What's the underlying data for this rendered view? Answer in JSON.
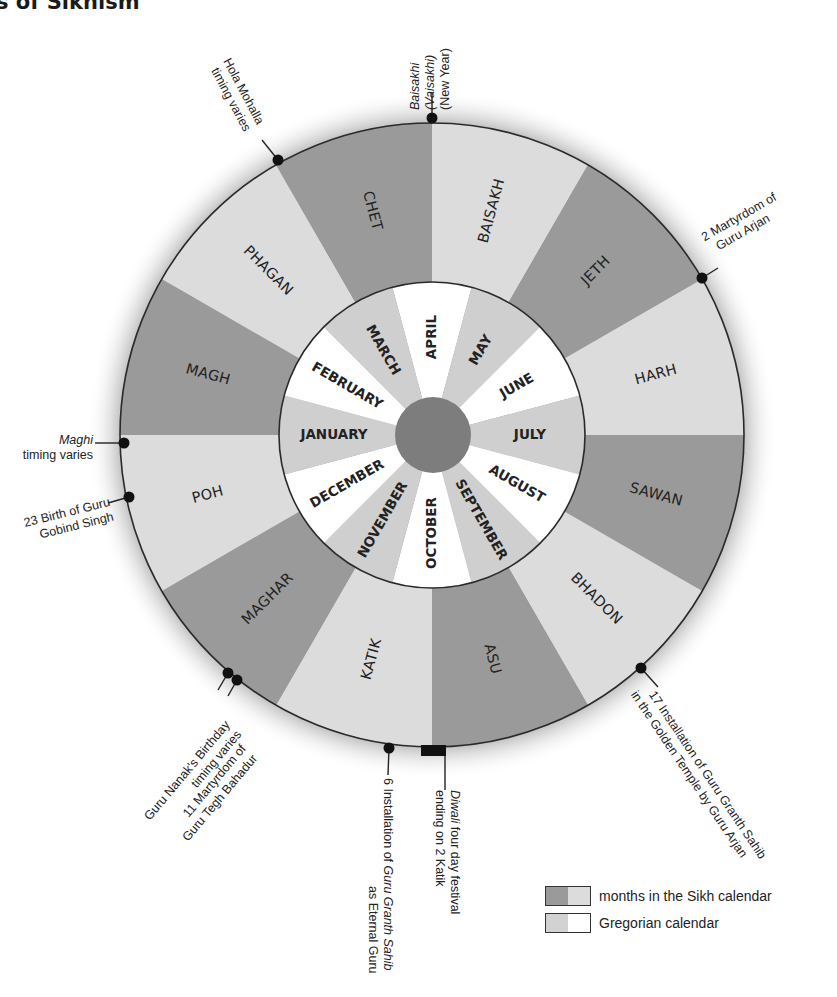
{
  "title_visible": "ts of Sikhism",
  "colors": {
    "sikh_dark": "#9a9a9a",
    "sikh_light": "#dcdcdc",
    "greg_gray": "#cfcfcf",
    "greg_white": "#ffffff",
    "hub": "#7d7d7d",
    "outline": "#2a2a2a",
    "marker": "#111111"
  },
  "outer_ring": {
    "label": "months in the Sikh calendar",
    "segments": [
      {
        "name": "BAISAKH",
        "shade": "light"
      },
      {
        "name": "JETH",
        "shade": "dark"
      },
      {
        "name": "HARH",
        "shade": "light"
      },
      {
        "name": "SAWAN",
        "shade": "dark"
      },
      {
        "name": "BHADON",
        "shade": "light"
      },
      {
        "name": "ASU",
        "shade": "dark"
      },
      {
        "name": "KATIK",
        "shade": "light"
      },
      {
        "name": "MAGHAR",
        "shade": "dark"
      },
      {
        "name": "POH",
        "shade": "light"
      },
      {
        "name": "MAGH",
        "shade": "dark"
      },
      {
        "name": "PHAGAN",
        "shade": "light"
      },
      {
        "name": "CHET",
        "shade": "dark"
      }
    ]
  },
  "inner_ring": {
    "label": "Gregorian calendar",
    "segments": [
      {
        "name": "APRIL",
        "shade": "white"
      },
      {
        "name": "MAY",
        "shade": "gray"
      },
      {
        "name": "JUNE",
        "shade": "white"
      },
      {
        "name": "JULY",
        "shade": "gray"
      },
      {
        "name": "AUGUST",
        "shade": "white"
      },
      {
        "name": "SEPTEMBER",
        "shade": "gray"
      },
      {
        "name": "OCTOBER",
        "shade": "white"
      },
      {
        "name": "NOVEMBER",
        "shade": "gray"
      },
      {
        "name": "DECEMBER",
        "shade": "white"
      },
      {
        "name": "JANUARY",
        "shade": "gray"
      },
      {
        "name": "FEBRUARY",
        "shade": "white"
      },
      {
        "name": "MARCH",
        "shade": "gray"
      }
    ]
  },
  "annotations": {
    "baisakhi": {
      "line1": "Baisakhi",
      "line2": "(Vaisakhi)",
      "line3": "(New Year)"
    },
    "hola_mohalla": {
      "line1": "Hola Mohalla",
      "line2": "timing varies"
    },
    "martyrdom_arjan": {
      "line1": "2 Martyrdom of",
      "line2": "Guru Arjan"
    },
    "maghi": {
      "line1": "Maghi",
      "line2": "timing varies"
    },
    "birth_gobind": {
      "line1": "23 Birth of Guru",
      "line2": "Gobind Singh"
    },
    "nanak_birthday": {
      "line1": "Guru Nanak's Birthday",
      "line2": "timing varies"
    },
    "martyrdom_tegh": {
      "line1": "11 Martyrdom of",
      "line2": "Guru Tegh Bahadur"
    },
    "installation_eternal": {
      "line1a": "6 Installation of ",
      "line1b": "Guru Granth Sahib",
      "line2": "as Eternal Guru"
    },
    "diwali": {
      "line1a": "Diwali",
      "line1b": " four day festival",
      "line2": "ending on 2 Katik"
    },
    "installation_golden": {
      "line1": "17 Installation of Guru Granth Sahib",
      "line2": "in the Golden Temple by Guru Arjan"
    }
  },
  "legend": {
    "items": [
      {
        "label": "months in the Sikh calendar",
        "left": "#9a9a9a",
        "right": "#dcdcdc"
      },
      {
        "label": "Gregorian calendar",
        "left": "#d2d2d2",
        "right": "#ffffff"
      }
    ]
  }
}
